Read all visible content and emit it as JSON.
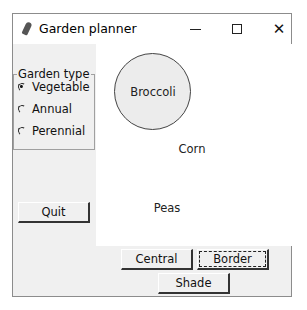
{
  "window": {
    "title": "Garden planner",
    "icon": "feather-icon",
    "controls": {
      "minimize": "minimize-icon",
      "maximize": "maximize-icon",
      "close": "✕"
    }
  },
  "garden_type": {
    "label": "Garden type",
    "options": [
      {
        "label": "Vegetable",
        "checked": true
      },
      {
        "label": "Annual",
        "checked": false
      },
      {
        "label": "Perennial",
        "checked": false
      }
    ]
  },
  "canvas": {
    "circle_label": "Broccoli",
    "labels": [
      "Corn",
      "Peas"
    ]
  },
  "buttons": {
    "quit": "Quit",
    "central": "Central",
    "border": "Border",
    "shade": "Shade"
  }
}
